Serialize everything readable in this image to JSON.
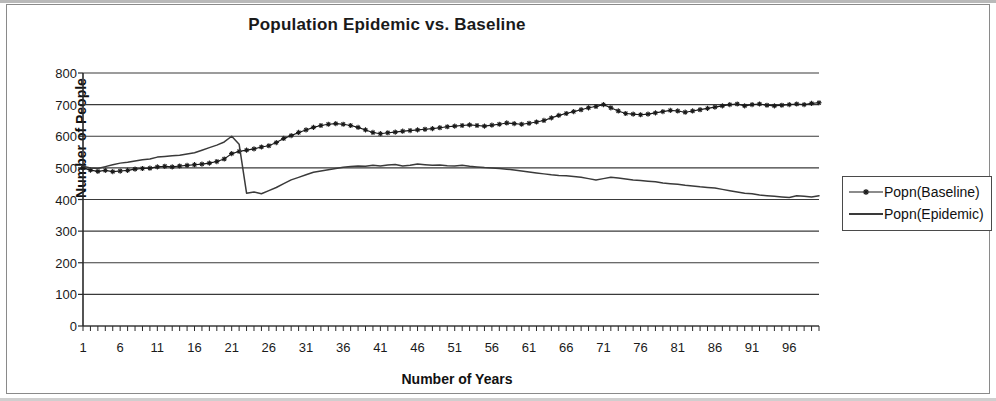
{
  "chart_data": {
    "type": "line",
    "title": "Population Epidemic vs. Baseline",
    "xlabel": "Number of Years",
    "ylabel": "Number of People",
    "xlim": [
      1,
      100
    ],
    "ylim": [
      0,
      800
    ],
    "ytick_labels": [
      "800",
      "700",
      "600",
      "500",
      "400",
      "300",
      "200",
      "100",
      "0"
    ],
    "ytick_values": [
      800,
      700,
      600,
      500,
      400,
      300,
      200,
      100,
      0
    ],
    "xtick_labels": [
      "1",
      "6",
      "11",
      "16",
      "21",
      "26",
      "31",
      "36",
      "41",
      "46",
      "51",
      "56",
      "61",
      "66",
      "71",
      "76",
      "81",
      "86",
      "91",
      "96"
    ],
    "xtick_values": [
      1,
      6,
      11,
      16,
      21,
      26,
      31,
      36,
      41,
      46,
      51,
      56,
      61,
      66,
      71,
      76,
      81,
      86,
      91,
      96
    ],
    "grid": "horizontal",
    "legend_position": "right",
    "x": [
      1,
      2,
      3,
      4,
      5,
      6,
      7,
      8,
      9,
      10,
      11,
      12,
      13,
      14,
      15,
      16,
      17,
      18,
      19,
      20,
      21,
      22,
      23,
      24,
      25,
      26,
      27,
      28,
      29,
      30,
      31,
      32,
      33,
      34,
      35,
      36,
      37,
      38,
      39,
      40,
      41,
      42,
      43,
      44,
      45,
      46,
      47,
      48,
      49,
      50,
      51,
      52,
      53,
      54,
      55,
      56,
      57,
      58,
      59,
      60,
      61,
      62,
      63,
      64,
      65,
      66,
      67,
      68,
      69,
      70,
      71,
      72,
      73,
      74,
      75,
      76,
      77,
      78,
      79,
      80,
      81,
      82,
      83,
      84,
      85,
      86,
      87,
      88,
      89,
      90,
      91,
      92,
      93,
      94,
      95,
      96,
      97,
      98,
      99,
      100
    ],
    "series": [
      {
        "name": "Popn(Baseline)",
        "marker": "star",
        "color": "#1a1a1a",
        "values": [
          500,
          493,
          489,
          492,
          488,
          490,
          492,
          496,
          498,
          499,
          503,
          505,
          503,
          506,
          508,
          510,
          512,
          515,
          520,
          528,
          545,
          552,
          556,
          560,
          566,
          570,
          580,
          593,
          602,
          612,
          620,
          628,
          634,
          638,
          640,
          638,
          634,
          628,
          620,
          612,
          608,
          611,
          613,
          616,
          618,
          620,
          622,
          624,
          627,
          630,
          632,
          634,
          636,
          634,
          632,
          635,
          638,
          642,
          640,
          638,
          641,
          645,
          650,
          658,
          666,
          672,
          678,
          684,
          690,
          694,
          700,
          690,
          680,
          672,
          670,
          668,
          670,
          674,
          678,
          682,
          680,
          676,
          680,
          684,
          688,
          692,
          696,
          700,
          702,
          696,
          700,
          702,
          698,
          696,
          698,
          700,
          702,
          700,
          704,
          706
        ]
      },
      {
        "name": "Popn(Epidemic)",
        "marker": "none",
        "color": "#3a3a3a",
        "values": [
          505,
          500,
          498,
          504,
          510,
          515,
          518,
          522,
          526,
          528,
          534,
          536,
          538,
          540,
          544,
          548,
          556,
          564,
          572,
          582,
          600,
          575,
          420,
          424,
          418,
          428,
          438,
          450,
          462,
          470,
          478,
          486,
          490,
          494,
          498,
          502,
          504,
          506,
          505,
          508,
          506,
          509,
          511,
          506,
          508,
          512,
          510,
          508,
          509,
          507,
          506,
          508,
          505,
          503,
          501,
          500,
          498,
          496,
          493,
          490,
          487,
          484,
          481,
          478,
          476,
          475,
          473,
          470,
          466,
          462,
          466,
          470,
          468,
          465,
          462,
          460,
          458,
          456,
          452,
          450,
          448,
          445,
          443,
          440,
          438,
          436,
          432,
          428,
          424,
          420,
          418,
          414,
          412,
          410,
          408,
          406,
          412,
          410,
          408,
          412
        ]
      }
    ]
  },
  "legend": {
    "items": [
      {
        "label": "Popn(Baseline)"
      },
      {
        "label": "Popn(Epidemic)"
      }
    ]
  }
}
